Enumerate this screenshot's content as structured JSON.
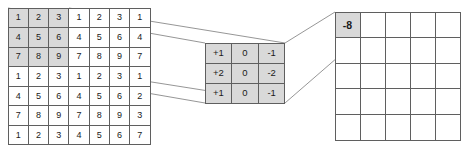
{
  "diagram": {
    "colors": {
      "background": "#ffffff",
      "grid_line": "#5f5f5f",
      "shade": "#d9d9d9",
      "connector_line": "#8a8a8a",
      "text": "#1a1a1a"
    }
  },
  "input_grid": {
    "name": "input-feature-map",
    "rows": 7,
    "cols": 7,
    "highlight": {
      "row_start": 0,
      "col_start": 0,
      "rows": 3,
      "cols": 3
    },
    "values": [
      [
        "1",
        "2",
        "3",
        "1",
        "2",
        "3",
        "1"
      ],
      [
        "4",
        "5",
        "6",
        "4",
        "5",
        "6",
        "4"
      ],
      [
        "7",
        "8",
        "9",
        "7",
        "8",
        "9",
        "7"
      ],
      [
        "1",
        "2",
        "3",
        "1",
        "2",
        "3",
        "1"
      ],
      [
        "4",
        "5",
        "6",
        "4",
        "5",
        "6",
        "2"
      ],
      [
        "7",
        "8",
        "9",
        "7",
        "8",
        "9",
        "3"
      ],
      [
        "1",
        "2",
        "3",
        "4",
        "5",
        "6",
        "7"
      ]
    ]
  },
  "kernel_grid": {
    "name": "sobel-kernel",
    "rows": 3,
    "cols": 3,
    "values": [
      [
        "+1",
        "0",
        "-1"
      ],
      [
        "+2",
        "0",
        "-2"
      ],
      [
        "+1",
        "0",
        "-1"
      ]
    ]
  },
  "output_grid": {
    "name": "output-feature-map",
    "rows": 5,
    "cols": 5,
    "highlight": {
      "row_start": 0,
      "col_start": 0,
      "rows": 1,
      "cols": 1
    },
    "values": [
      [
        "-8",
        "",
        "",
        "",
        ""
      ],
      [
        "",
        "",
        "",
        "",
        ""
      ],
      [
        "",
        "",
        "",
        "",
        ""
      ],
      [
        "",
        "",
        "",
        "",
        ""
      ],
      [
        "",
        "",
        "",
        "",
        ""
      ]
    ]
  },
  "connectors": [
    {
      "name": "input-top-to-kernel-top",
      "x1": 8,
      "y1": 8,
      "x2": 205,
      "y2": 43
    },
    {
      "name": "input-top-to-kernel-right-top",
      "x1": 69,
      "y1": 8,
      "x2": 285,
      "y2": 43
    },
    {
      "name": "input-bottom-to-kernel-left-bottom",
      "x1": 8,
      "y1": 69,
      "x2": 205,
      "y2": 103
    },
    {
      "name": "input-bottom-to-kernel-bottom",
      "x1": 69,
      "y1": 69,
      "x2": 285,
      "y2": 103
    },
    {
      "name": "kernel-top-to-output-cell-top",
      "x1": 285,
      "y1": 43,
      "x2": 335,
      "y2": 12
    },
    {
      "name": "kernel-bottom-to-output-cell-bottom",
      "x1": 285,
      "y1": 103,
      "x2": 360,
      "y2": 38
    }
  ]
}
